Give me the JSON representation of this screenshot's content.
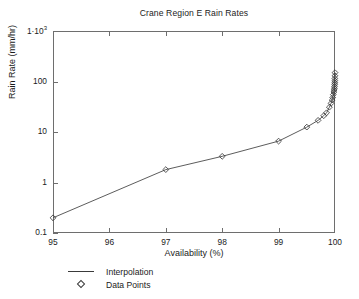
{
  "chart_data": {
    "type": "line",
    "title": "Crane Region E Rain Rates",
    "xlabel": "Availability (%)",
    "ylabel": "Rain Rate (mm/hr)",
    "xscale": "linear",
    "yscale": "log",
    "xlim": [
      95,
      100
    ],
    "ylim": [
      0.1,
      1000
    ],
    "grid": false,
    "legend_position": "below-left",
    "xticks": [
      "95",
      "96",
      "97",
      "98",
      "99",
      "100"
    ],
    "xtick_values": [
      95,
      96,
      97,
      98,
      99,
      100
    ],
    "yticks": [
      "0.1",
      "1",
      "10",
      "100",
      "1·10³"
    ],
    "ytick_values": [
      0.1,
      1,
      10,
      100,
      1000
    ],
    "legend": [
      {
        "label": "Interpolation",
        "marker": "line"
      },
      {
        "label": "Data Points",
        "marker": "diamond"
      }
    ],
    "series": [
      {
        "name": "Data Points",
        "x": [
          95,
          97,
          98,
          99,
          99.5,
          99.7,
          99.8,
          99.85,
          99.9,
          99.93,
          99.95,
          99.96,
          99.97,
          99.98,
          99.985,
          99.99,
          99.993,
          99.995,
          99.996,
          99.997,
          99.998,
          99.999,
          100
        ],
        "y": [
          0.2,
          1.8,
          3.3,
          6.6,
          12.5,
          17,
          21,
          24,
          31,
          37,
          43,
          48,
          55,
          62,
          68,
          74,
          80,
          88,
          95,
          104,
          115,
          130,
          150
        ]
      }
    ]
  },
  "yaxis_exponent_label": {
    "mantissa": "1·10",
    "exponent": "3"
  }
}
